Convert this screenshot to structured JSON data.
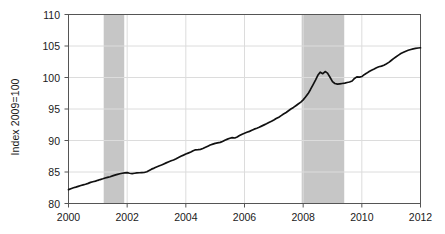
{
  "chart_data": {
    "type": "line",
    "title": "",
    "subtitle": "",
    "xlabel": "",
    "ylabel": "Index 2009=100",
    "xlim": [
      2000,
      2012
    ],
    "ylim": [
      80,
      110
    ],
    "grid": true,
    "grid_axis": "y",
    "legend": "none",
    "line_color": "#111111",
    "shade_color": "#c6c6c6",
    "axis_color": "#555555",
    "grid_color": "#dcdcdc",
    "xticks": [
      2000,
      2002,
      2004,
      2006,
      2008,
      2010,
      2012
    ],
    "xtick_labels": [
      "2000",
      "2002",
      "2004",
      "2006",
      "2008",
      "2010",
      "2012"
    ],
    "yticks": [
      80,
      85,
      90,
      95,
      100,
      105,
      110
    ],
    "ytick_labels": [
      "80",
      "85",
      "90",
      "95",
      "100",
      "105",
      "110"
    ],
    "shaded_regions": [
      {
        "name": "recession-2001",
        "x0": 2001.2,
        "x1": 2001.9
      },
      {
        "name": "recession-2008",
        "x0": 2007.95,
        "x1": 2009.4
      }
    ],
    "series": [
      {
        "name": "index",
        "x": [
          2000.0,
          2000.08,
          2000.17,
          2000.25,
          2000.33,
          2000.42,
          2000.5,
          2000.58,
          2000.67,
          2000.75,
          2000.83,
          2000.92,
          2001.0,
          2001.08,
          2001.17,
          2001.25,
          2001.33,
          2001.42,
          2001.5,
          2001.58,
          2001.67,
          2001.75,
          2001.83,
          2001.92,
          2002.0,
          2002.08,
          2002.17,
          2002.25,
          2002.33,
          2002.42,
          2002.5,
          2002.58,
          2002.67,
          2002.75,
          2002.83,
          2002.92,
          2003.0,
          2003.08,
          2003.17,
          2003.25,
          2003.33,
          2003.42,
          2003.5,
          2003.58,
          2003.67,
          2003.75,
          2003.83,
          2003.92,
          2004.0,
          2004.08,
          2004.17,
          2004.25,
          2004.33,
          2004.42,
          2004.5,
          2004.58,
          2004.67,
          2004.75,
          2004.83,
          2004.92,
          2005.0,
          2005.08,
          2005.17,
          2005.25,
          2005.33,
          2005.42,
          2005.5,
          2005.58,
          2005.67,
          2005.75,
          2005.83,
          2005.92,
          2006.0,
          2006.08,
          2006.17,
          2006.25,
          2006.33,
          2006.42,
          2006.5,
          2006.58,
          2006.67,
          2006.75,
          2006.83,
          2006.92,
          2007.0,
          2007.08,
          2007.17,
          2007.25,
          2007.33,
          2007.42,
          2007.5,
          2007.58,
          2007.67,
          2007.75,
          2007.83,
          2007.92,
          2008.0,
          2008.08,
          2008.17,
          2008.25,
          2008.33,
          2008.42,
          2008.5,
          2008.58,
          2008.67,
          2008.75,
          2008.83,
          2008.92,
          2009.0,
          2009.08,
          2009.17,
          2009.25,
          2009.33,
          2009.42,
          2009.5,
          2009.58,
          2009.67,
          2009.75,
          2009.83,
          2009.92,
          2010.0,
          2010.08,
          2010.17,
          2010.25,
          2010.33,
          2010.42,
          2010.5,
          2010.58,
          2010.67,
          2010.75,
          2010.83,
          2010.92,
          2011.0,
          2011.08,
          2011.17,
          2011.25,
          2011.33,
          2011.42,
          2011.5,
          2011.58,
          2011.67,
          2011.75,
          2011.83,
          2011.92,
          2012.0
        ],
        "y": [
          82.2,
          82.35,
          82.5,
          82.6,
          82.72,
          82.85,
          82.95,
          83.05,
          83.2,
          83.35,
          83.45,
          83.55,
          83.68,
          83.8,
          83.92,
          84.05,
          84.15,
          84.25,
          84.38,
          84.5,
          84.62,
          84.72,
          84.8,
          84.86,
          84.9,
          84.8,
          84.75,
          84.8,
          84.85,
          84.88,
          84.9,
          84.92,
          85.05,
          85.25,
          85.45,
          85.62,
          85.8,
          85.95,
          86.1,
          86.28,
          86.45,
          86.62,
          86.78,
          86.9,
          87.1,
          87.3,
          87.5,
          87.68,
          87.85,
          88.0,
          88.18,
          88.38,
          88.52,
          88.55,
          88.6,
          88.72,
          88.92,
          89.1,
          89.28,
          89.42,
          89.55,
          89.62,
          89.7,
          89.85,
          90.05,
          90.22,
          90.35,
          90.45,
          90.4,
          90.55,
          90.78,
          91.0,
          91.15,
          91.3,
          91.45,
          91.62,
          91.8,
          91.95,
          92.1,
          92.28,
          92.48,
          92.65,
          92.85,
          93.05,
          93.25,
          93.48,
          93.7,
          93.95,
          94.2,
          94.45,
          94.72,
          95.0,
          95.25,
          95.52,
          95.8,
          96.1,
          96.45,
          96.9,
          97.45,
          98.1,
          98.8,
          99.6,
          100.35,
          100.85,
          100.6,
          100.95,
          100.7,
          100.0,
          99.35,
          99.05,
          98.95,
          99.0,
          99.05,
          99.1,
          99.2,
          99.28,
          99.45,
          99.85,
          100.1,
          100.05,
          100.15,
          100.45,
          100.7,
          100.95,
          101.15,
          101.35,
          101.55,
          101.7,
          101.8,
          101.95,
          102.15,
          102.4,
          102.7,
          103.0,
          103.3,
          103.55,
          103.8,
          104.0,
          104.18,
          104.32,
          104.45,
          104.55,
          104.62,
          104.68,
          104.72
        ]
      }
    ]
  }
}
